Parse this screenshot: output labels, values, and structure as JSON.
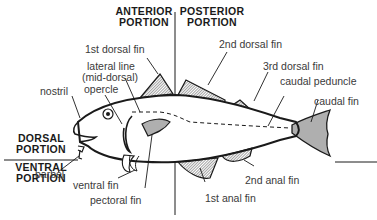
{
  "diagram": {
    "regions": {
      "anterior": [
        "ANTERIOR",
        "PORTION"
      ],
      "posterior": [
        "POSTERIOR",
        "PORTION"
      ],
      "dorsal": [
        "DORSAL",
        "PORTION"
      ],
      "ventral": [
        "VENTRAL",
        "PORTION"
      ]
    },
    "labels": {
      "first_dorsal_fin": "1st dorsal fin",
      "lateral_line": "lateral line",
      "lateral_line_note": "(mid-dorsal)",
      "nostril": "nostril",
      "opercle": "opercle",
      "second_dorsal_fin": "2nd dorsal fin",
      "third_dorsal_fin": "3rd dorsal fin",
      "caudal_peduncle": "caudal peduncle",
      "caudal_fin": "caudal fin",
      "barbel": "barbel",
      "ventral_fin": "ventral fin",
      "pectoral_fin": "pectoral fin",
      "second_anal_fin": "2nd anal fin",
      "first_anal_fin": "1st anal fin"
    },
    "colors": {
      "ink": "#1a1a1a",
      "label": "#3a3a3a",
      "background": "#ffffff"
    }
  }
}
